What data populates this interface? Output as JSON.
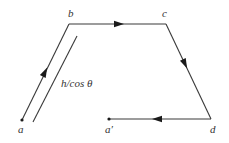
{
  "diagram": {
    "type": "closed-path-cycle",
    "points": {
      "a": {
        "label": "a",
        "x": 22,
        "y": 120
      },
      "b": {
        "label": "b",
        "x": 69,
        "y": 24
      },
      "c": {
        "label": "c",
        "x": 166,
        "y": 24
      },
      "d": {
        "label": "d",
        "x": 211,
        "y": 119
      },
      "a_prime": {
        "label": "a′",
        "x": 109,
        "y": 119
      }
    },
    "segments": [
      {
        "from": "a",
        "to": "b",
        "direction": "a-to-b"
      },
      {
        "from": "b",
        "to": "c",
        "direction": "b-to-c"
      },
      {
        "from": "c",
        "to": "d",
        "direction": "c-to-d"
      },
      {
        "from": "d",
        "to": "a_prime",
        "direction": "d-to-a_prime"
      }
    ],
    "dimension": {
      "label": "h/cos θ",
      "applies_to": "segment a-b"
    },
    "colors": {
      "line": "#3a3a3a",
      "arrow": "#1a1a1a",
      "text": "#333333",
      "background": "#ffffff"
    }
  }
}
